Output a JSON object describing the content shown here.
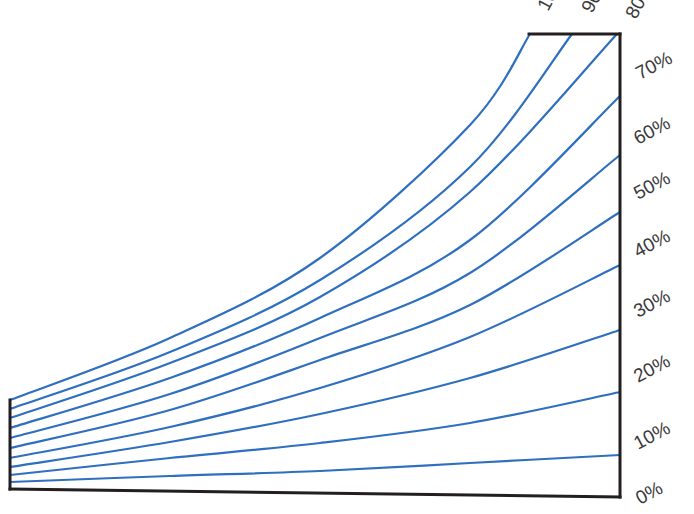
{
  "chart_data": {
    "type": "line",
    "title": "",
    "xlabel": "",
    "ylabel": "",
    "grid": false,
    "legend": "none",
    "colors": {
      "curve": "#2f6fc0",
      "frame": "#231f20",
      "label": "#3a3a3a"
    },
    "frame": {
      "left_axis": {
        "x": 10,
        "y_top": 400,
        "y_bottom": 489
      },
      "baseline": {
        "x1": 10,
        "y1": 489,
        "x2": 620,
        "y2": 497
      },
      "right_axis": {
        "x": 620,
        "y_top": 34,
        "y_bottom": 497
      },
      "top_edge": {
        "x1": 529,
        "x2": 620,
        "y": 34
      }
    },
    "right_labels": [
      {
        "text": "70%",
        "x": 640,
        "y": 80
      },
      {
        "text": "60%",
        "x": 638,
        "y": 145
      },
      {
        "text": "50%",
        "x": 638,
        "y": 200
      },
      {
        "text": "40%",
        "x": 638,
        "y": 258
      },
      {
        "text": "30%",
        "x": 638,
        "y": 318
      },
      {
        "text": "20%",
        "x": 638,
        "y": 383
      },
      {
        "text": "10%",
        "x": 638,
        "y": 450
      },
      {
        "text": "0%",
        "x": 640,
        "y": 505
      }
    ],
    "top_labels": [
      {
        "text": "100%",
        "x": 548,
        "y": 12
      },
      {
        "text": "90%",
        "x": 592,
        "y": 14
      },
      {
        "text": "80%",
        "x": 636,
        "y": 20
      }
    ],
    "series": [
      {
        "name": "100%",
        "points": [
          [
            10,
            400
          ],
          [
            170,
            338
          ],
          [
            320,
            258
          ],
          [
            470,
            125
          ],
          [
            530,
            34
          ]
        ]
      },
      {
        "name": "90%",
        "points": [
          [
            10,
            409
          ],
          [
            170,
            352
          ],
          [
            320,
            280
          ],
          [
            470,
            167
          ],
          [
            572,
            34
          ]
        ]
      },
      {
        "name": "80%",
        "points": [
          [
            10,
            418
          ],
          [
            170,
            363
          ],
          [
            320,
            297
          ],
          [
            470,
            192
          ],
          [
            617,
            34
          ]
        ]
      },
      {
        "name": "70%",
        "points": [
          [
            10,
            428
          ],
          [
            170,
            378
          ],
          [
            320,
            318
          ],
          [
            470,
            240
          ],
          [
            620,
            96
          ]
        ]
      },
      {
        "name": "60%",
        "points": [
          [
            10,
            438
          ],
          [
            170,
            394
          ],
          [
            320,
            338
          ],
          [
            470,
            273
          ],
          [
            620,
            155
          ]
        ]
      },
      {
        "name": "50%",
        "points": [
          [
            10,
            448
          ],
          [
            170,
            410
          ],
          [
            320,
            360
          ],
          [
            470,
            305
          ],
          [
            620,
            212
          ]
        ]
      },
      {
        "name": "40%",
        "points": [
          [
            10,
            458
          ],
          [
            170,
            427
          ],
          [
            320,
            388
          ],
          [
            470,
            337
          ],
          [
            620,
            265
          ]
        ]
      },
      {
        "name": "30%",
        "points": [
          [
            10,
            467
          ],
          [
            170,
            442
          ],
          [
            320,
            414
          ],
          [
            470,
            378
          ],
          [
            620,
            330
          ]
        ]
      },
      {
        "name": "20%",
        "points": [
          [
            10,
            475
          ],
          [
            170,
            458
          ],
          [
            320,
            443
          ],
          [
            470,
            423
          ],
          [
            620,
            392
          ]
        ]
      },
      {
        "name": "10%",
        "points": [
          [
            10,
            482
          ],
          [
            170,
            476
          ],
          [
            320,
            471
          ],
          [
            470,
            463
          ],
          [
            620,
            455
          ]
        ]
      }
    ]
  }
}
